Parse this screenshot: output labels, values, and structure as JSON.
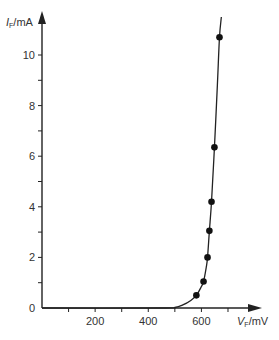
{
  "chart_data": {
    "type": "line",
    "title": "",
    "xlabel": "V_F/mV",
    "ylabel": "I_F/mA",
    "xlabel_parts": {
      "main": "V",
      "sub": "F",
      "unit": "/mV"
    },
    "ylabel_parts": {
      "main": "I",
      "sub": "F",
      "unit": "/mA"
    },
    "xlim": [
      0,
      800
    ],
    "ylim": [
      0,
      11
    ],
    "x_ticks": [
      100,
      200,
      300,
      400,
      500,
      600,
      700
    ],
    "x_tick_labels": [
      {
        "value": 200,
        "label": "200"
      },
      {
        "value": 400,
        "label": "400"
      },
      {
        "value": 600,
        "label": "600"
      }
    ],
    "y_ticks": [
      1,
      2,
      3,
      4,
      5,
      6,
      7,
      8,
      9,
      10
    ],
    "y_tick_labels": [
      {
        "value": 0,
        "label": "0"
      },
      {
        "value": 2,
        "label": "2"
      },
      {
        "value": 4,
        "label": "4"
      },
      {
        "value": 6,
        "label": "6"
      },
      {
        "value": 8,
        "label": "8"
      },
      {
        "value": 10,
        "label": "10"
      }
    ],
    "grid": false,
    "legend": null,
    "series": [
      {
        "name": "measured points",
        "type": "scatter",
        "x": [
          581,
          608,
          623,
          630,
          638,
          649,
          668
        ],
        "y": [
          0.5,
          1.05,
          2.0,
          3.05,
          4.2,
          6.35,
          10.7
        ]
      },
      {
        "name": "fitted curve",
        "type": "line",
        "x": [
          0,
          450,
          500,
          530,
          560,
          581,
          600,
          608,
          618,
          623,
          630,
          638,
          649,
          660,
          668,
          675
        ],
        "y": [
          0,
          0,
          0.02,
          0.12,
          0.3,
          0.5,
          0.85,
          1.05,
          1.6,
          2.0,
          3.05,
          4.2,
          6.35,
          8.8,
          10.7,
          11.5
        ]
      }
    ]
  },
  "colors": {
    "axis": "#222222",
    "curve": "#222222",
    "points": "#111111",
    "text": "#333333"
  }
}
